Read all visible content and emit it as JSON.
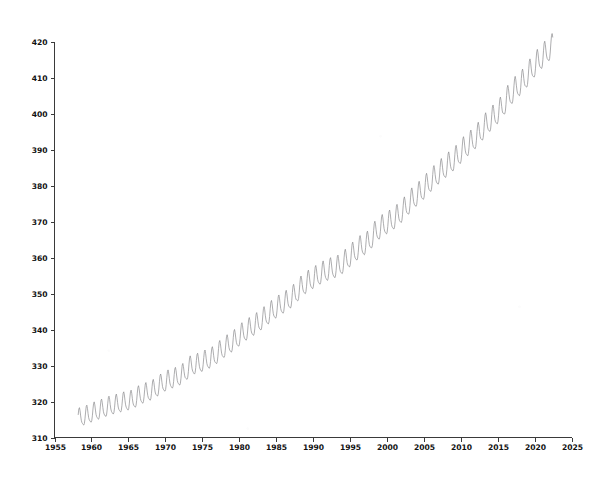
{
  "chart_data": {
    "type": "line",
    "title": "",
    "subtitle": "",
    "xlabel": "",
    "ylabel": "",
    "xlim": [
      1955,
      2025
    ],
    "ylim": [
      310,
      420
    ],
    "grid": false,
    "legend": null,
    "annotations": [],
    "x_ticks": [
      1955,
      1960,
      1965,
      1970,
      1975,
      1980,
      1985,
      1990,
      1995,
      2000,
      2005,
      2010,
      2015,
      2020,
      2025
    ],
    "x_tick_labels": [
      "1955",
      "1960",
      "1965",
      "1970",
      "1975",
      "1980",
      "1985",
      "1990",
      "1995",
      "2000",
      "2005",
      "2010",
      "2015",
      "2020",
      "2025"
    ],
    "y_ticks": [
      310,
      320,
      330,
      340,
      350,
      360,
      370,
      380,
      390,
      400,
      410,
      420
    ],
    "y_tick_labels": [
      "310",
      "320",
      "330",
      "340",
      "350",
      "360",
      "370",
      "380",
      "390",
      "400",
      "410",
      "420"
    ],
    "series": [
      {
        "name": "Monthly mean CO2",
        "color": "#8d8d90",
        "line_width": 0.72,
        "marker": "none",
        "x_start": 1958.21,
        "x_end": 1958.21,
        "sampling": "monthly",
        "description": "Rising sawtooth: long-term accelerating increase with an annual seasonal cycle peaking in May and troughing in September-October.",
        "annual_mean_by_year": {
          "1958": 315.3,
          "1959": 315.98,
          "1960": 316.91,
          "1961": 317.64,
          "1962": 318.45,
          "1963": 318.99,
          "1964": 319.62,
          "1965": 320.04,
          "1966": 321.37,
          "1967": 322.18,
          "1968": 323.05,
          "1969": 324.62,
          "1970": 325.68,
          "1971": 326.32,
          "1972": 327.46,
          "1973": 329.68,
          "1974": 330.19,
          "1975": 331.12,
          "1976": 332.03,
          "1977": 333.84,
          "1978": 335.41,
          "1979": 336.84,
          "1980": 338.76,
          "1981": 340.12,
          "1982": 341.48,
          "1983": 343.15,
          "1984": 344.87,
          "1985": 346.35,
          "1986": 347.61,
          "1987": 349.31,
          "1988": 351.69,
          "1989": 353.2,
          "1990": 354.45,
          "1991": 355.7,
          "1992": 356.54,
          "1993": 357.21,
          "1994": 358.96,
          "1995": 360.97,
          "1996": 362.74,
          "1997": 363.88,
          "1998": 366.84,
          "1999": 368.54,
          "2000": 369.71,
          "2001": 371.32,
          "2002": 373.45,
          "2003": 375.98,
          "2004": 377.7,
          "2005": 379.98,
          "2006": 382.09,
          "2007": 384.02,
          "2008": 385.83,
          "2009": 387.64,
          "2010": 390.1,
          "2011": 391.85,
          "2012": 394.06,
          "2013": 396.74,
          "2014": 398.81,
          "2015": 401.01,
          "2016": 404.41,
          "2017": 406.76,
          "2018": 408.72,
          "2019": 411.66,
          "2020": 414.24,
          "2021": 416.45,
          "2022": 418.56
        },
        "seasonal_amplitude_start": 5.8,
        "seasonal_amplitude_end": 7.4,
        "seasonal_peak_month": 5,
        "first_point": {
          "x": 1958.21,
          "y": 315.7
        },
        "last_point": {
          "x": 1958.21,
          "y": 417.0
        },
        "max_value": 420.1,
        "min_value": 312.9
      }
    ]
  },
  "axes": {
    "y_axis_name": "y-axis",
    "x_axis_name": "x-axis"
  }
}
